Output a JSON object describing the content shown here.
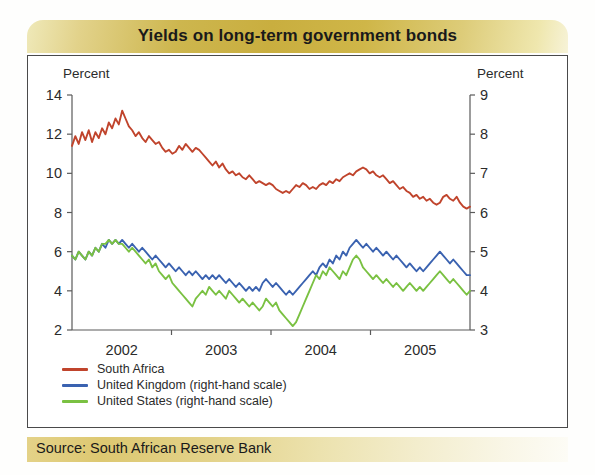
{
  "title": "Yields on long-term government bonds",
  "source": "Source: South African Reserve Bank",
  "axis_titles": {
    "left": "Percent",
    "right": "Percent"
  },
  "legend": [
    {
      "label": "South Africa",
      "color": "#c0442c"
    },
    {
      "label": "United Kingdom (right-hand scale)",
      "color": "#3a62b0"
    },
    {
      "label": "United States (right-hand scale)",
      "color": "#7ac142"
    }
  ],
  "chart_data": {
    "type": "line",
    "title": "Yields on long-term government bonds",
    "xlabel": "",
    "ylabel": "Percent",
    "ylabel_right": "Percent",
    "grid": false,
    "legend_position": "bottom-left",
    "x_tick_labels": [
      "2002",
      "2003",
      "2004",
      "2005"
    ],
    "x_tick_positions": [
      0.5,
      1.5,
      2.5,
      3.5
    ],
    "xlim": [
      0,
      4
    ],
    "ylim": [
      2,
      14
    ],
    "ylim_right": [
      3,
      9
    ],
    "y_ticks": [
      2,
      4,
      6,
      8,
      10,
      12,
      14
    ],
    "y_ticks_right": [
      3,
      4,
      5,
      6,
      7,
      8,
      9
    ],
    "series": [
      {
        "name": "South Africa",
        "axis": "left",
        "color": "#c0442c",
        "values": [
          11.4,
          11.9,
          11.5,
          12.1,
          11.7,
          12.2,
          11.6,
          12.1,
          11.8,
          12.3,
          12.0,
          12.6,
          12.3,
          12.8,
          12.5,
          13.2,
          12.8,
          12.4,
          12.2,
          11.9,
          12.1,
          11.8,
          11.6,
          11.9,
          11.7,
          11.5,
          11.6,
          11.3,
          11.1,
          11.2,
          11.0,
          11.1,
          11.4,
          11.2,
          11.5,
          11.3,
          11.1,
          11.3,
          11.2,
          11.0,
          10.8,
          10.6,
          10.4,
          10.6,
          10.3,
          10.5,
          10.2,
          10.0,
          10.1,
          9.9,
          10.0,
          9.8,
          9.7,
          9.9,
          9.7,
          9.5,
          9.6,
          9.5,
          9.4,
          9.5,
          9.4,
          9.2,
          9.1,
          9.0,
          9.1,
          9.0,
          9.2,
          9.4,
          9.3,
          9.5,
          9.4,
          9.2,
          9.3,
          9.2,
          9.4,
          9.5,
          9.4,
          9.6,
          9.5,
          9.7,
          9.6,
          9.8,
          9.9,
          10.0,
          9.9,
          10.1,
          10.2,
          10.3,
          10.2,
          10.0,
          10.1,
          9.9,
          9.8,
          9.9,
          9.7,
          9.5,
          9.6,
          9.4,
          9.2,
          9.3,
          9.1,
          9.0,
          8.8,
          8.9,
          8.7,
          8.8,
          8.6,
          8.7,
          8.5,
          8.4,
          8.5,
          8.8,
          8.9,
          8.7,
          8.6,
          8.8,
          8.5,
          8.3,
          8.2,
          8.3
        ]
      },
      {
        "name": "United Kingdom (right-hand scale)",
        "axis": "right",
        "color": "#3a62b0",
        "values": [
          4.9,
          4.8,
          5.0,
          4.9,
          4.8,
          5.0,
          4.9,
          5.1,
          5.0,
          5.2,
          5.1,
          5.3,
          5.2,
          5.3,
          5.2,
          5.3,
          5.2,
          5.1,
          5.2,
          5.1,
          5.0,
          5.1,
          5.0,
          4.9,
          4.8,
          4.9,
          4.8,
          4.7,
          4.6,
          4.7,
          4.6,
          4.5,
          4.6,
          4.5,
          4.4,
          4.5,
          4.4,
          4.5,
          4.4,
          4.3,
          4.4,
          4.3,
          4.4,
          4.3,
          4.4,
          4.3,
          4.2,
          4.3,
          4.2,
          4.1,
          4.2,
          4.1,
          4.0,
          4.1,
          4.0,
          4.1,
          4.0,
          4.2,
          4.3,
          4.2,
          4.1,
          4.2,
          4.1,
          4.0,
          3.9,
          4.0,
          3.9,
          4.0,
          4.1,
          4.2,
          4.3,
          4.4,
          4.5,
          4.4,
          4.6,
          4.7,
          4.6,
          4.8,
          4.7,
          4.9,
          4.8,
          5.0,
          4.9,
          5.1,
          5.2,
          5.3,
          5.2,
          5.1,
          5.2,
          5.1,
          5.0,
          5.1,
          5.0,
          4.9,
          5.0,
          4.9,
          4.8,
          4.9,
          4.8,
          4.7,
          4.6,
          4.7,
          4.6,
          4.5,
          4.6,
          4.5,
          4.6,
          4.7,
          4.8,
          4.9,
          5.0,
          4.9,
          4.8,
          4.7,
          4.8,
          4.7,
          4.6,
          4.5,
          4.4,
          4.4
        ]
      },
      {
        "name": "United States (right-hand scale)",
        "axis": "right",
        "color": "#7ac142",
        "values": [
          4.9,
          4.8,
          5.0,
          4.9,
          4.8,
          5.0,
          4.9,
          5.1,
          5.0,
          5.2,
          5.2,
          5.3,
          5.2,
          5.3,
          5.2,
          5.2,
          5.1,
          5.0,
          5.1,
          5.0,
          4.9,
          4.8,
          4.7,
          4.8,
          4.6,
          4.7,
          4.5,
          4.4,
          4.3,
          4.4,
          4.2,
          4.1,
          4.0,
          3.9,
          3.8,
          3.7,
          3.6,
          3.8,
          3.9,
          4.0,
          3.9,
          4.1,
          4.0,
          3.9,
          4.0,
          3.9,
          3.8,
          4.0,
          3.9,
          3.8,
          3.7,
          3.8,
          3.7,
          3.6,
          3.7,
          3.6,
          3.5,
          3.6,
          3.8,
          3.7,
          3.6,
          3.7,
          3.5,
          3.4,
          3.3,
          3.2,
          3.1,
          3.2,
          3.4,
          3.6,
          3.8,
          4.0,
          4.2,
          4.4,
          4.3,
          4.5,
          4.4,
          4.6,
          4.5,
          4.4,
          4.3,
          4.5,
          4.4,
          4.6,
          4.8,
          4.9,
          4.8,
          4.6,
          4.5,
          4.4,
          4.3,
          4.4,
          4.3,
          4.2,
          4.3,
          4.2,
          4.1,
          4.2,
          4.1,
          4.0,
          4.1,
          4.2,
          4.1,
          4.0,
          4.1,
          4.0,
          4.1,
          4.2,
          4.3,
          4.4,
          4.5,
          4.4,
          4.3,
          4.2,
          4.3,
          4.2,
          4.1,
          4.0,
          3.9,
          4.0
        ]
      }
    ]
  }
}
